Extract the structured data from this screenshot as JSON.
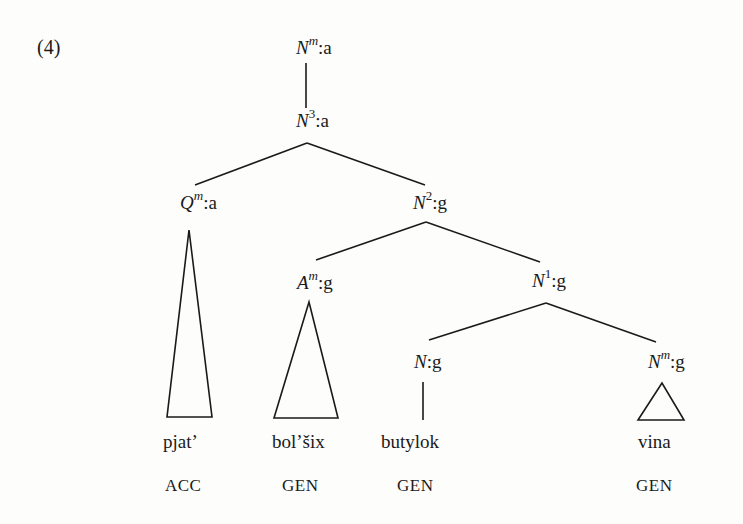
{
  "example_number": "(4)",
  "nodes": {
    "root": {
      "cat": "N",
      "sup": "m",
      "feat": ":a"
    },
    "n3": {
      "cat": "N",
      "sup": "3",
      "feat": ":a"
    },
    "qm": {
      "cat": "Q",
      "sup": "m",
      "feat": ":a"
    },
    "n2": {
      "cat": "N",
      "sup": "2",
      "feat": ":g"
    },
    "am": {
      "cat": "A",
      "sup": "m",
      "feat": ":g"
    },
    "n1": {
      "cat": "N",
      "sup": "1",
      "feat": ":g"
    },
    "n0": {
      "cat": "N",
      "sup": "",
      "feat": ":g"
    },
    "nm": {
      "cat": "N",
      "sup": "m",
      "feat": ":g"
    }
  },
  "leaves": [
    {
      "word": "pjat’",
      "case": "ACC"
    },
    {
      "word": "bol’šix",
      "case": "GEN"
    },
    {
      "word": "butylok",
      "case": "GEN"
    },
    {
      "word": "vina",
      "case": "GEN"
    }
  ]
}
